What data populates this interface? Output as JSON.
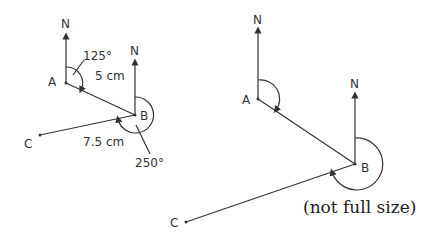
{
  "sketch": {
    "labels": {
      "north_a": "N",
      "north_b": "N",
      "point_a": "A",
      "point_b": "B",
      "point_c": "C",
      "bearing_ab": "125°",
      "distance_ab": "5 cm",
      "distance_bc": "7.5 cm",
      "bearing_bc": "250°"
    }
  },
  "scale_drawing": {
    "labels": {
      "north_a": "N",
      "north_b": "N",
      "point_a": "A",
      "point_b": "B",
      "point_c": "C"
    },
    "caption": "(not full size)"
  },
  "colors": {
    "line": "#333333",
    "background": "#ffffff"
  }
}
